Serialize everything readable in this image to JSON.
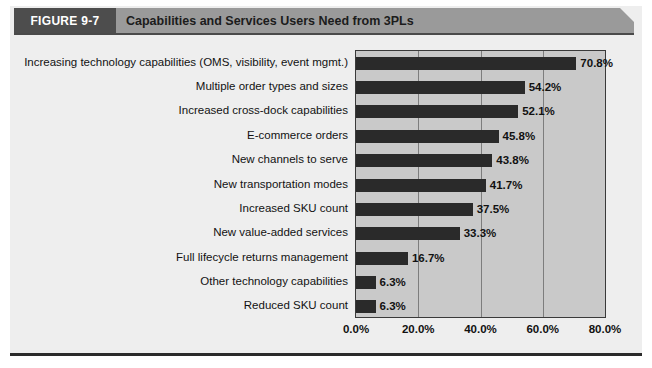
{
  "figure": {
    "tag": "FIGURE 9-7",
    "title": "Capabilities and Services Users Need from 3PLs"
  },
  "chart_data": {
    "type": "bar",
    "orientation": "horizontal",
    "title": "Capabilities and Services Users Need from 3PLs",
    "xlabel": "",
    "ylabel": "",
    "xlim": [
      0,
      80
    ],
    "xticks": [
      "0.0%",
      "20.0%",
      "40.0%",
      "60.0%",
      "80.0%"
    ],
    "xtick_values": [
      0,
      20,
      40,
      60,
      80
    ],
    "grid": true,
    "legend": "none",
    "categories": [
      "Increasing technology capabilities (OMS, visibility, event mgmt.)",
      "Multiple order types and sizes",
      "Increased cross-dock capabilities",
      "E-commerce orders",
      "New channels to serve",
      "New transportation modes",
      "Increased SKU count",
      "New value-added services",
      "Full lifecycle returns management",
      "Other technology capabilities",
      "Reduced SKU count"
    ],
    "values": [
      70.8,
      54.2,
      52.1,
      45.8,
      43.8,
      41.7,
      37.5,
      33.3,
      16.7,
      6.3,
      6.3
    ],
    "data_labels": [
      "70.8%",
      "54.2%",
      "52.1%",
      "45.8%",
      "43.8%",
      "41.7%",
      "37.5%",
      "33.3%",
      "16.7%",
      "6.3%",
      "6.3%"
    ],
    "colors": {
      "bar": "#2a2a2a",
      "plot_background": "#c9c9c9",
      "gridline": "#7d7d7d",
      "panel_background": "#eeeeee",
      "banner": "#9a9a9a",
      "tag_background": "#4d4d4d"
    }
  }
}
